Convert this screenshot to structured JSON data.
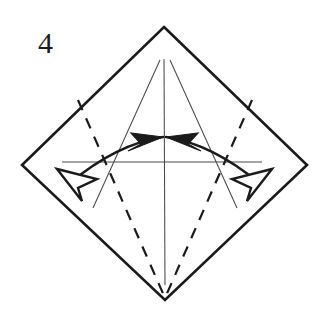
{
  "figure": {
    "step_number": "4",
    "caption": "",
    "background_color": "#ffffff",
    "ink_color": "#1b1b1b",
    "thin_crease_color": "#4a4a4a"
  },
  "sheet": {
    "name": "square-rotated-45",
    "vertices": {
      "top": [
        164,
        27
      ],
      "left": [
        22,
        165
      ],
      "right": [
        307,
        165
      ],
      "bottom": [
        165,
        300
      ]
    },
    "outline_points": "164,27 307,165 165,300 22,165",
    "stroke_width": 2.6
  },
  "creases": {
    "thin": [
      {
        "name": "vertical-center-crease",
        "kind": "valley-existing",
        "points": "164,59 165,285"
      },
      {
        "name": "left-slanted-crease",
        "kind": "valley-existing",
        "points": "160,60 93,208"
      },
      {
        "name": "right-slanted-crease",
        "kind": "valley-existing",
        "points": "170,60 237,208"
      },
      {
        "name": "horizontal-center-crease",
        "kind": "valley-existing",
        "points": "62,162 262,162"
      }
    ],
    "dashed": [
      {
        "name": "left-mountain-fold",
        "kind": "mountain-new",
        "points": "78,100 165,298"
      },
      {
        "name": "right-mountain-fold",
        "kind": "mountain-new",
        "points": "252,100 165,298"
      }
    ]
  },
  "arrows": [
    {
      "name": "left-fold-arrow",
      "direction": "inward-and-outward",
      "tail_path": "M 70,183 C 100,158 130,142 163,137",
      "solid_head_points": "163,137 131,133 141,144 128,151",
      "hollow_head_points": "57,169 97,179 78,188 82,201",
      "description": "double-headed curved arrow: solid head points up-right to center, hollow head points down-left"
    },
    {
      "name": "right-fold-arrow",
      "direction": "inward-and-outward",
      "tail_path": "M 259,183 C 229,158 199,142 166,137",
      "solid_head_points": "166,137 198,133 188,144 201,151",
      "hollow_head_points": "272,169 232,179 251,188 247,201",
      "description": "double-headed curved arrow: solid head points up-left to center, hollow head points down-right"
    }
  ]
}
